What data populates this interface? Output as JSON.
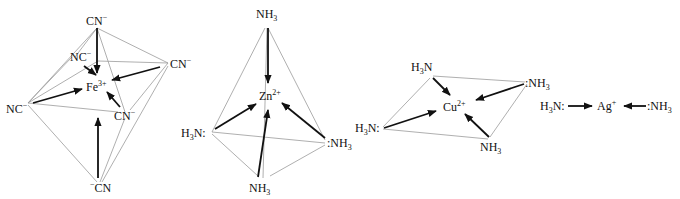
{
  "diagram": {
    "type": "coordination-complex-geometries",
    "colors": {
      "edge": "#9a9a9a",
      "arrow": "#111111",
      "text": "#111111"
    },
    "complexes": [
      {
        "id": "fe",
        "geometry": "octahedral",
        "center": {
          "symbol": "Fe",
          "charge": "3+"
        },
        "ligands": [
          {
            "label": "CN",
            "charge": "−",
            "position": "top"
          },
          {
            "label": "NC",
            "charge": "−",
            "position": "back-left"
          },
          {
            "label": "CN",
            "charge": "−",
            "position": "right"
          },
          {
            "label": "NC",
            "charge": "−",
            "position": "left"
          },
          {
            "label": "CN",
            "charge": "−",
            "position": "front-right"
          },
          {
            "label": "CN",
            "charge": "−",
            "prefix_charge": true,
            "position": "bottom"
          }
        ]
      },
      {
        "id": "zn",
        "geometry": "tetrahedral",
        "center": {
          "symbol": "Zn",
          "charge": "2+"
        },
        "ligands": [
          {
            "label": "NH",
            "sub": "3",
            "position": "top"
          },
          {
            "label": "H",
            "sub": "3",
            "label2": "N:",
            "position": "left"
          },
          {
            "label": ":NH",
            "sub": "3",
            "position": "right"
          },
          {
            "label": "NH",
            "sub": "3",
            "position": "bottom"
          }
        ]
      },
      {
        "id": "cu",
        "geometry": "square-planar",
        "center": {
          "symbol": "Cu",
          "charge": "2+"
        },
        "ligands": [
          {
            "label": "H",
            "sub": "3",
            "label2": "N",
            "position": "top-left"
          },
          {
            "label": ":NH",
            "sub": "3",
            "position": "top-right"
          },
          {
            "label": "H",
            "sub": "3",
            "label2": "N:",
            "position": "left"
          },
          {
            "label": "NH",
            "sub": "3",
            "position": "bottom-right"
          }
        ]
      },
      {
        "id": "ag",
        "geometry": "linear",
        "center": {
          "symbol": "Ag",
          "charge": "+"
        },
        "ligands": [
          {
            "label": "H",
            "sub": "3",
            "label2": "N:",
            "position": "left"
          },
          {
            "label": ":NH",
            "sub": "3",
            "position": "right"
          }
        ]
      }
    ]
  }
}
